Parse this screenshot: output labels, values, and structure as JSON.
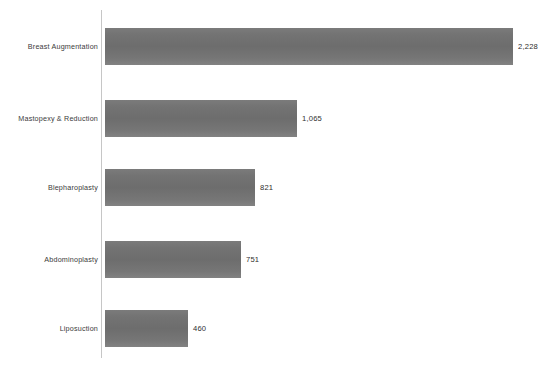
{
  "chart_data": {
    "type": "bar",
    "orientation": "horizontal",
    "title": "",
    "subtitle": "",
    "xlabel": "",
    "ylabel": "",
    "grid": false,
    "legend": false,
    "axis_line_color": "#c6c6c6",
    "bar_color": "#737373",
    "background_color": "#ffffff",
    "xlim": [
      0,
      2228
    ],
    "categories": [
      "Breast Augmentation",
      "Mastopexy & Reduction",
      "Blepharoplasty",
      "Abdominoplasty",
      "Liposuction"
    ],
    "values": [
      2228,
      1065,
      821,
      751,
      460
    ],
    "value_labels": [
      "2,228",
      "1,065",
      "821",
      "751",
      "460"
    ],
    "series": [
      {
        "name": "",
        "values": [
          2228,
          1065,
          821,
          751,
          460
        ]
      }
    ]
  },
  "bars": [
    {
      "category": "Breast Augmentation",
      "value": 2228,
      "value_label": "2,228",
      "bar_width_px": 408,
      "row_top_px": 28
    },
    {
      "category": "Mastopexy & Reduction",
      "value": 1065,
      "value_label": "1,065",
      "bar_width_px": 192,
      "row_top_px": 100
    },
    {
      "category": "Blepharoplasty",
      "value": 821,
      "value_label": "821",
      "bar_width_px": 150,
      "row_top_px": 169
    },
    {
      "category": "Abdominoplasty",
      "value": 751,
      "value_label": "751",
      "bar_width_px": 136,
      "row_top_px": 241
    },
    {
      "category": "Liposuction",
      "value": 460,
      "value_label": "460",
      "bar_width_px": 83,
      "row_top_px": 310
    }
  ],
  "footer": {
    "clipped_caption": ""
  }
}
